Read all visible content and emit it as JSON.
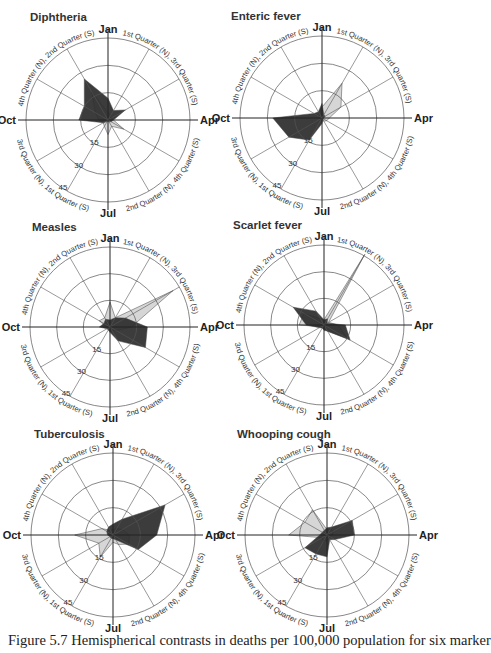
{
  "caption": "Figure 5.7  Hemispherical contrasts in deaths per 100,000 population for six marker",
  "top_fragment": "...ry diagrams ...",
  "axis_labels": {
    "months": [
      "Jan",
      "Apr",
      "Jul",
      "Oct"
    ],
    "quarters": [
      "1st Quarter (N), 3rd Quarter (S)",
      "4th Quarter (N), 2nd Quarter (S)",
      "3rd Quarter (N), 1st Quarter (S)",
      "2nd Quarter (N), 4th Quarter (S)"
    ],
    "ring_values": [
      "15",
      "30",
      "45"
    ]
  },
  "colors": {
    "north": "#2b2b2b",
    "north_overlap": "#6a6a6a",
    "south": "#d6d6d6",
    "grid": "#555555"
  },
  "chart_data": [
    {
      "type": "radar",
      "title": "Diphtheria",
      "categories": [
        "Jan",
        "Feb",
        "Mar",
        "Apr",
        "May",
        "Jun",
        "Jul",
        "Aug",
        "Sep",
        "Oct",
        "Nov",
        "Dec"
      ],
      "rmax": 45,
      "rings": [
        15,
        30,
        45
      ],
      "series": [
        {
          "name": "Northern hemisphere",
          "values": [
            12,
            6,
            11,
            3,
            2,
            1,
            1,
            1,
            3,
            16,
            15,
            26
          ]
        },
        {
          "name": "Southern hemisphere",
          "values": [
            4,
            3,
            2,
            3,
            10,
            4,
            8,
            4,
            3,
            5,
            8,
            18
          ]
        }
      ]
    },
    {
      "type": "radar",
      "title": "Enteric fever",
      "categories": [
        "Jan",
        "Feb",
        "Mar",
        "Apr",
        "May",
        "Jun",
        "Jul",
        "Aug",
        "Sep",
        "Oct",
        "Nov",
        "Dec"
      ],
      "rmax": 45,
      "rings": [
        15,
        30,
        45
      ],
      "series": [
        {
          "name": "Northern hemisphere",
          "values": [
            8,
            2,
            2,
            1,
            1,
            1,
            3,
            14,
            21,
            27,
            5,
            4
          ]
        },
        {
          "name": "Southern hemisphere",
          "values": [
            6,
            22,
            12,
            4,
            3,
            2,
            1,
            1,
            1,
            1,
            2,
            3
          ]
        }
      ]
    },
    {
      "type": "radar",
      "title": "Measles",
      "categories": [
        "Jan",
        "Feb",
        "Mar",
        "Apr",
        "May",
        "Jun",
        "Jul",
        "Aug",
        "Sep",
        "Oct",
        "Nov",
        "Dec"
      ],
      "rmax": 45,
      "rings": [
        15,
        30,
        45
      ],
      "series": [
        {
          "name": "Northern hemisphere",
          "values": [
            4,
            6,
            10,
            21,
            23,
            9,
            3,
            2,
            2,
            6,
            4,
            5
          ]
        },
        {
          "name": "Southern hemisphere",
          "values": [
            14,
            6,
            41,
            12,
            4,
            2,
            1,
            1,
            1,
            2,
            7,
            6
          ]
        }
      ]
    },
    {
      "type": "radar",
      "title": "Scarlet fever",
      "categories": [
        "Jan",
        "Feb",
        "Mar",
        "Apr",
        "May",
        "Jun",
        "Jul",
        "Aug",
        "Sep",
        "Oct",
        "Nov",
        "Dec"
      ],
      "rmax": 45,
      "rings": [
        15,
        30,
        45
      ],
      "series": [
        {
          "name": "Northern hemisphere",
          "values": [
            3,
            4,
            2,
            12,
            17,
            4,
            3,
            2,
            3,
            10,
            20,
            9
          ]
        },
        {
          "name": "Southern hemisphere",
          "values": [
            3,
            46,
            3,
            8,
            15,
            4,
            2,
            2,
            2,
            14,
            13,
            4
          ]
        }
      ]
    },
    {
      "type": "radar",
      "title": "Tuberculosis",
      "categories": [
        "Jan",
        "Feb",
        "Mar",
        "Apr",
        "May",
        "Jun",
        "Jul",
        "Aug",
        "Sep",
        "Oct",
        "Nov",
        "Dec"
      ],
      "rmax": 45,
      "rings": [
        15,
        30,
        45
      ],
      "series": [
        {
          "name": "Northern hemisphere",
          "values": [
            6,
            10,
            33,
            24,
            16,
            3,
            2,
            2,
            2,
            3,
            4,
            5
          ]
        },
        {
          "name": "Southern hemisphere",
          "values": [
            3,
            4,
            6,
            9,
            10,
            6,
            4,
            14,
            9,
            21,
            7,
            3
          ]
        }
      ]
    },
    {
      "type": "radar",
      "title": "Whooping cough",
      "categories": [
        "Jan",
        "Feb",
        "Mar",
        "Apr",
        "May",
        "Jun",
        "Jul",
        "Aug",
        "Sep",
        "Oct",
        "Nov",
        "Dec"
      ],
      "rmax": 45,
      "rings": [
        15,
        30,
        45
      ],
      "series": [
        {
          "name": "Northern hemisphere",
          "values": [
            4,
            5,
            16,
            15,
            5,
            3,
            12,
            12,
            14,
            4,
            3,
            3
          ]
        },
        {
          "name": "Southern hemisphere",
          "values": [
            3,
            4,
            4,
            3,
            2,
            2,
            3,
            4,
            3,
            21,
            14,
            16
          ]
        }
      ]
    }
  ],
  "layout": [
    {
      "cx": 108,
      "cy": 120,
      "r": 82,
      "title_x": 30,
      "title_y": 11
    },
    {
      "cx": 322,
      "cy": 118,
      "r": 82,
      "title_x": 231,
      "title_y": 10
    },
    {
      "cx": 110,
      "cy": 327,
      "r": 80,
      "title_x": 32,
      "title_y": 221
    },
    {
      "cx": 324,
      "cy": 325,
      "r": 80,
      "title_x": 233,
      "title_y": 219
    },
    {
      "cx": 113,
      "cy": 535,
      "r": 82,
      "title_x": 34,
      "title_y": 428
    },
    {
      "cx": 327,
      "cy": 535,
      "r": 82,
      "title_x": 237,
      "title_y": 428
    }
  ]
}
